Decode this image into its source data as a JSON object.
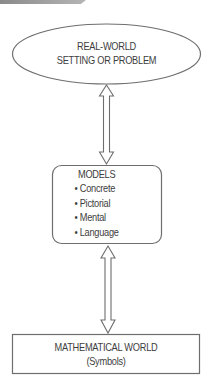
{
  "banner": {
    "color": "#9a9a9a"
  },
  "nodes": {
    "real_world": {
      "shape": "ellipse",
      "line1": "REAL-WORLD",
      "line2": "SETTING OR PROBLEM"
    },
    "models": {
      "shape": "rounded-rectangle",
      "title": "MODELS",
      "bullet": "•",
      "items": [
        "Concrete",
        "Pictorial",
        "Mental",
        "Language"
      ]
    },
    "math_world": {
      "shape": "rectangle",
      "line1": "MATHEMATICAL WORLD",
      "line2": "(Symbols)"
    }
  },
  "edges": [
    {
      "from": "real_world",
      "to": "models",
      "type": "bidirectional-arrow"
    },
    {
      "from": "models",
      "to": "math_world",
      "type": "bidirectional-arrow"
    }
  ],
  "colors": {
    "stroke": "#6e6e6e",
    "text": "#3d3d3d",
    "background": "#ffffff"
  }
}
